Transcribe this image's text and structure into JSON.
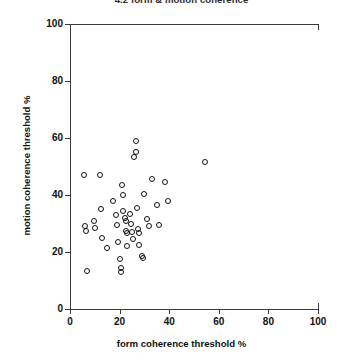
{
  "chart_data": {
    "type": "scatter",
    "title": "4.2 form & motion coherence",
    "xlabel": "form coherence threshold %",
    "ylabel": "motion coherence threshold %",
    "xlim": [
      0,
      100
    ],
    "ylim": [
      0,
      100
    ],
    "xticks": [
      0,
      20,
      40,
      60,
      80,
      100
    ],
    "yticks": [
      0,
      20,
      40,
      60,
      80,
      100
    ],
    "grid": false,
    "legend": null,
    "marker": "open-circle",
    "marker_color": "#111111",
    "points": [
      [
        5.5,
        47.0
      ],
      [
        6.0,
        29.0
      ],
      [
        6.5,
        27.5
      ],
      [
        7.0,
        13.5
      ],
      [
        9.5,
        31.0
      ],
      [
        10.0,
        28.5
      ],
      [
        12.0,
        47.0
      ],
      [
        12.5,
        35.0
      ],
      [
        13.0,
        25.0
      ],
      [
        15.0,
        21.5
      ],
      [
        17.5,
        38.0
      ],
      [
        18.5,
        33.0
      ],
      [
        19.0,
        29.5
      ],
      [
        19.5,
        23.5
      ],
      [
        20.0,
        17.5
      ],
      [
        20.5,
        14.5
      ],
      [
        20.5,
        13.0
      ],
      [
        21.0,
        43.5
      ],
      [
        21.5,
        40.0
      ],
      [
        21.5,
        34.5
      ],
      [
        22.0,
        32.0
      ],
      [
        22.5,
        31.0
      ],
      [
        22.5,
        27.5
      ],
      [
        23.0,
        26.5
      ],
      [
        23.0,
        22.0
      ],
      [
        24.0,
        33.5
      ],
      [
        24.5,
        30.0
      ],
      [
        25.0,
        27.0
      ],
      [
        25.5,
        24.5
      ],
      [
        26.0,
        53.5
      ],
      [
        26.5,
        55.0
      ],
      [
        26.5,
        59.0
      ],
      [
        27.0,
        35.5
      ],
      [
        27.5,
        28.0
      ],
      [
        28.0,
        26.5
      ],
      [
        28.0,
        22.5
      ],
      [
        29.0,
        18.5
      ],
      [
        29.5,
        18.0
      ],
      [
        30.0,
        40.5
      ],
      [
        31.0,
        31.5
      ],
      [
        32.0,
        29.0
      ],
      [
        33.0,
        45.5
      ],
      [
        35.0,
        36.5
      ],
      [
        36.0,
        29.5
      ],
      [
        38.5,
        44.5
      ],
      [
        39.5,
        38.0
      ],
      [
        54.5,
        51.5
      ]
    ]
  }
}
